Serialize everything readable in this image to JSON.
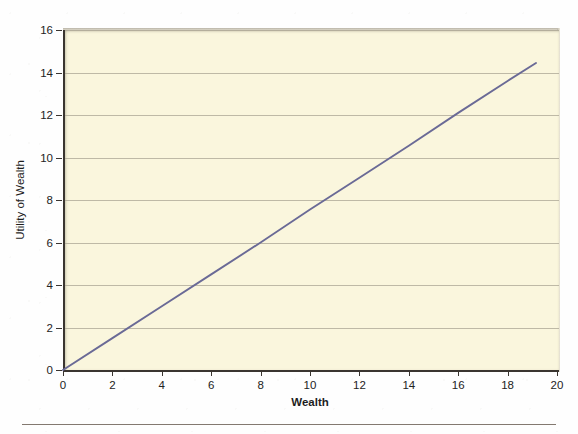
{
  "chart_data": {
    "type": "line",
    "title": "",
    "subtitle": "",
    "xlabel": "Wealth",
    "ylabel": "Utility of Wealth",
    "xlim": [
      0,
      20
    ],
    "ylim": [
      0,
      16
    ],
    "xticks": [
      0,
      2,
      4,
      6,
      8,
      10,
      12,
      14,
      16,
      18,
      20
    ],
    "yticks": [
      0,
      2,
      4,
      6,
      8,
      10,
      12,
      14,
      16
    ],
    "xtick_labels": [
      "0",
      "2",
      "4",
      "6",
      "8",
      "10",
      "12",
      "14",
      "16",
      "18",
      "20"
    ],
    "ytick_labels": [
      "0",
      "2",
      "4",
      "6",
      "8",
      "10",
      "12",
      "14",
      "16"
    ],
    "grid": "horizontal",
    "legend": "none",
    "series": [
      {
        "name": "Utility of Wealth",
        "type": "line",
        "color": "#6a6a96",
        "x": [
          0,
          2,
          4,
          6,
          8,
          10,
          12,
          14,
          16,
          18,
          19.15
        ],
        "values": [
          0,
          1.5,
          3.0,
          4.5,
          6.0,
          7.55,
          9.05,
          10.55,
          12.1,
          13.6,
          14.45
        ]
      }
    ],
    "annotations": [],
    "colors": {
      "line": "#6a6a96",
      "plot_background": "#faf6dd",
      "figure_background": "#fefefe",
      "axis": "#3a3530",
      "gridline": "#a9a493",
      "text": "#1e1e1e",
      "rule": "#6d6257"
    }
  }
}
